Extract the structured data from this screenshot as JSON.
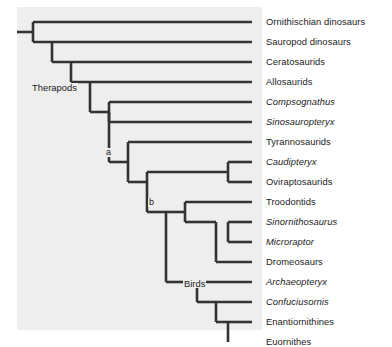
{
  "figure": {
    "type": "cladogram",
    "title": "",
    "background_color": "#ffffff",
    "panel_color": "#eeeeee",
    "line_color": "#333333"
  },
  "tips": [
    {
      "label": "Ornithischian dinosaurs",
      "italic": false,
      "y": 22,
      "branch_x": 33
    },
    {
      "label": "Sauropod dinosaurs",
      "italic": false,
      "y": 42,
      "branch_x": 52
    },
    {
      "label": "Ceratosaurids",
      "italic": false,
      "y": 62,
      "branch_x": 71
    },
    {
      "label": "Allosaurids",
      "italic": false,
      "y": 82,
      "branch_x": 90
    },
    {
      "label": "Compsognathus",
      "italic": true,
      "y": 102,
      "branch_x": 109
    },
    {
      "label": "Sinosauropteryx",
      "italic": true,
      "y": 122,
      "branch_x": 109
    },
    {
      "label": "Tyrannosaurids",
      "italic": false,
      "y": 142,
      "branch_x": 128
    },
    {
      "label": "Caudipteryx",
      "italic": true,
      "y": 162,
      "branch_x": 228
    },
    {
      "label": "Oviraptosaurids",
      "italic": false,
      "y": 182,
      "branch_x": 228
    },
    {
      "label": "Troodontids",
      "italic": false,
      "y": 202,
      "branch_x": 185
    },
    {
      "label": "Sinornithosaurus",
      "italic": true,
      "y": 222,
      "branch_x": 228
    },
    {
      "label": "Microraptor",
      "italic": true,
      "y": 242,
      "branch_x": 228
    },
    {
      "label": "Dromeosaurs",
      "italic": false,
      "y": 262,
      "branch_x": 216
    },
    {
      "label": "Archaeopteryx",
      "italic": true,
      "y": 282,
      "branch_x": 197
    },
    {
      "label": "Confuciusornis",
      "italic": true,
      "y": 302,
      "branch_x": 216
    },
    {
      "label": "Enantiornithines",
      "italic": false,
      "y": 322,
      "branch_x": 228
    },
    {
      "label": "Euornithes",
      "italic": false,
      "y": 342,
      "branch_x": 228
    }
  ],
  "node_labels": [
    {
      "name": "therapods",
      "text": "Therapods",
      "x": 31,
      "y": 88
    },
    {
      "name": "node-a",
      "text": "a",
      "x": 105,
      "y": 153
    },
    {
      "name": "node-b",
      "text": "b",
      "x": 148,
      "y": 203
    },
    {
      "name": "birds",
      "text": "Birds",
      "x": 183,
      "y": 284
    }
  ]
}
